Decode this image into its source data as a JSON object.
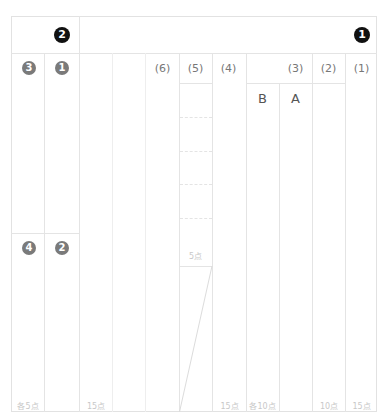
{
  "sheet": {
    "header": {
      "left_badge": "2",
      "right_badge": "1"
    },
    "left_block": {
      "badges": [
        {
          "id": "q3",
          "label": "3"
        },
        {
          "id": "q1",
          "label": "1"
        },
        {
          "id": "q4",
          "label": "4"
        },
        {
          "id": "q2",
          "label": "2"
        }
      ],
      "points": "各5点"
    },
    "right_block": {
      "columns": [
        {
          "label": "(6)",
          "points": "15点"
        },
        {
          "label": "(5)",
          "points": "5点"
        },
        {
          "label": "(4)",
          "points": "15点"
        },
        {
          "label": "(3)",
          "points": "各10点",
          "sub": [
            "B",
            "A"
          ]
        },
        {
          "label": "(2)",
          "points": "10点"
        },
        {
          "label": "(1)",
          "points": "15点"
        }
      ]
    },
    "colors": {
      "grid_line": "#e4e4e4",
      "badge_black": "#111111",
      "badge_grey": "#7a7a7a",
      "points_text": "#c8c8c8"
    }
  }
}
